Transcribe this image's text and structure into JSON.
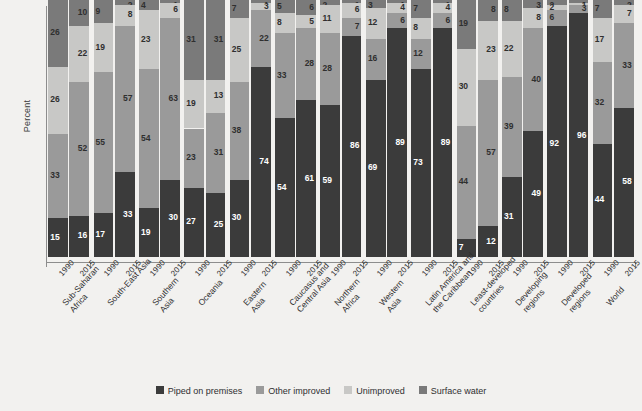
{
  "chart_data": {
    "type": "bar",
    "subtype": "stacked-percent",
    "title": "",
    "xlabel": "",
    "ylabel": "Percent",
    "ylim": [
      0,
      100
    ],
    "grid": false,
    "legend_position": "bottom",
    "series": [
      {
        "name": "Piped on premises",
        "color": "#3b3b3b",
        "values": [
          15,
          16,
          17,
          33,
          19,
          30,
          27,
          25,
          30,
          74,
          54,
          61,
          59,
          86,
          69,
          89,
          73,
          89,
          7,
          12,
          31,
          49,
          92,
          96,
          44,
          58
        ]
      },
      {
        "name": "Other improved",
        "color": "#9a9a9a",
        "values": [
          33,
          52,
          55,
          57,
          54,
          63,
          23,
          31,
          38,
          22,
          33,
          28,
          28,
          7,
          16,
          6,
          12,
          6,
          44,
          57,
          39,
          40,
          6,
          3,
          32,
          33
        ]
      },
      {
        "name": "Unimproved",
        "color": "#c8c8c6",
        "values": [
          26,
          22,
          19,
          8,
          23,
          6,
          19,
          13,
          25,
          3,
          8,
          5,
          11,
          6,
          12,
          4,
          8,
          4,
          30,
          23,
          22,
          8,
          2,
          1,
          17,
          7
        ]
      },
      {
        "name": "Surface water",
        "color": "#7a7a7a",
        "values": [
          26,
          10,
          9,
          2,
          4,
          1,
          31,
          31,
          7,
          1,
          5,
          6,
          2,
          1,
          3,
          1,
          7,
          1,
          19,
          8,
          8,
          3,
          2,
          1,
          7,
          2
        ]
      }
    ],
    "groups": [
      {
        "region": "Sub-Saharan Africa",
        "line1": "Sub-Saharan",
        "line2": "Africa",
        "years": [
          "1990",
          "2015"
        ]
      },
      {
        "region": "South-East Asia",
        "line1": "South-East Asia",
        "line2": "",
        "years": [
          "1990",
          "2015"
        ]
      },
      {
        "region": "Southern Asia",
        "line1": "Southern",
        "line2": "Asia",
        "years": [
          "1990",
          "2015"
        ]
      },
      {
        "region": "Oceania",
        "line1": "Oceania",
        "line2": "",
        "years": [
          "1990",
          "2015"
        ]
      },
      {
        "region": "Eastern Asia",
        "line1": "Eastern",
        "line2": "Asia",
        "years": [
          "1990",
          "2015"
        ]
      },
      {
        "region": "Caucasus and Central Asia",
        "line1": "Caucasus and",
        "line2": "Central Asia",
        "years": [
          "1990",
          "2015"
        ]
      },
      {
        "region": "Northern Africa",
        "line1": "Northern",
        "line2": "Africa",
        "years": [
          "1990",
          "2015"
        ]
      },
      {
        "region": "Western Asia",
        "line1": "Western",
        "line2": "Asia",
        "years": [
          "1990",
          "2015"
        ]
      },
      {
        "region": "Latin America and the Caribbean",
        "line1": "Latin America and",
        "line2": "the Caribbean",
        "years": [
          "1990",
          "2015"
        ]
      },
      {
        "region": "Least-developed countries",
        "line1": "Least-developed",
        "line2": "countries",
        "years": [
          "1990",
          "2015"
        ]
      },
      {
        "region": "Developing regions",
        "line1": "Developing",
        "line2": "regions",
        "years": [
          "1990",
          "2015"
        ]
      },
      {
        "region": "Developed regions",
        "line1": "Developed",
        "line2": "regions",
        "years": [
          "1990",
          "2015"
        ]
      },
      {
        "region": "World",
        "line1": "World",
        "line2": "",
        "years": [
          "1990",
          "2015"
        ]
      }
    ],
    "bars": [
      {
        "region": "Sub-Saharan Africa",
        "year": "1990",
        "piped_on_premises": 15,
        "other_improved": 33,
        "unimproved": 26,
        "surface_water": 26
      },
      {
        "region": "Sub-Saharan Africa",
        "year": "2015",
        "piped_on_premises": 16,
        "other_improved": 52,
        "unimproved": 22,
        "surface_water": 10
      },
      {
        "region": "South-East Asia",
        "year": "1990",
        "piped_on_premises": 17,
        "other_improved": 55,
        "unimproved": 19,
        "surface_water": 9
      },
      {
        "region": "South-East Asia",
        "year": "2015",
        "piped_on_premises": 33,
        "other_improved": 57,
        "unimproved": 8,
        "surface_water": 2
      },
      {
        "region": "Southern Asia",
        "year": "1990",
        "piped_on_premises": 19,
        "other_improved": 54,
        "unimproved": 23,
        "surface_water": 4
      },
      {
        "region": "Southern Asia",
        "year": "2015",
        "piped_on_premises": 30,
        "other_improved": 63,
        "unimproved": 6,
        "surface_water": 1
      },
      {
        "region": "Oceania",
        "year": "1990",
        "piped_on_premises": 27,
        "other_improved": 23,
        "unimproved": 19,
        "surface_water": 31
      },
      {
        "region": "Oceania",
        "year": "2015",
        "piped_on_premises": 25,
        "other_improved": 31,
        "unimproved": 13,
        "surface_water": 31
      },
      {
        "region": "Eastern Asia",
        "year": "1990",
        "piped_on_premises": 30,
        "other_improved": 38,
        "unimproved": 25,
        "surface_water": 7
      },
      {
        "region": "Eastern Asia",
        "year": "2015",
        "piped_on_premises": 74,
        "other_improved": 22,
        "unimproved": 3,
        "surface_water": 1
      },
      {
        "region": "Caucasus and Central Asia",
        "year": "1990",
        "piped_on_premises": 54,
        "other_improved": 33,
        "unimproved": 8,
        "surface_water": 5
      },
      {
        "region": "Caucasus and Central Asia",
        "year": "2015",
        "piped_on_premises": 61,
        "other_improved": 28,
        "unimproved": 5,
        "surface_water": 6
      },
      {
        "region": "Northern Africa",
        "year": "1990",
        "piped_on_premises": 59,
        "other_improved": 28,
        "unimproved": 11,
        "surface_water": 2
      },
      {
        "region": "Northern Africa",
        "year": "2015",
        "piped_on_premises": 86,
        "other_improved": 7,
        "unimproved": 6,
        "surface_water": 1
      },
      {
        "region": "Western Asia",
        "year": "1990",
        "piped_on_premises": 69,
        "other_improved": 16,
        "unimproved": 12,
        "surface_water": 3
      },
      {
        "region": "Western Asia",
        "year": "2015",
        "piped_on_premises": 89,
        "other_improved": 6,
        "unimproved": 4,
        "surface_water": 1
      },
      {
        "region": "Latin America and the Caribbean",
        "year": "1990",
        "piped_on_premises": 73,
        "other_improved": 12,
        "unimproved": 8,
        "surface_water": 7
      },
      {
        "region": "Latin America and the Caribbean",
        "year": "2015",
        "piped_on_premises": 89,
        "other_improved": 6,
        "unimproved": 4,
        "surface_water": 1
      },
      {
        "region": "Least-developed countries",
        "year": "1990",
        "piped_on_premises": 7,
        "other_improved": 44,
        "unimproved": 30,
        "surface_water": 19
      },
      {
        "region": "Least-developed countries",
        "year": "2015",
        "piped_on_premises": 12,
        "other_improved": 57,
        "unimproved": 23,
        "surface_water": 8
      },
      {
        "region": "Developing regions",
        "year": "1990",
        "piped_on_premises": 31,
        "other_improved": 39,
        "unimproved": 22,
        "surface_water": 8
      },
      {
        "region": "Developing regions",
        "year": "2015",
        "piped_on_premises": 49,
        "other_improved": 40,
        "unimproved": 8,
        "surface_water": 3
      },
      {
        "region": "Developed regions",
        "year": "1990",
        "piped_on_premises": 92,
        "other_improved": 6,
        "unimproved": 2,
        "surface_water": 2
      },
      {
        "region": "Developed regions",
        "year": "2015",
        "piped_on_premises": 96,
        "other_improved": 3,
        "unimproved": 1,
        "surface_water": 1
      },
      {
        "region": "World",
        "year": "1990",
        "piped_on_premises": 44,
        "other_improved": 32,
        "unimproved": 17,
        "surface_water": 7
      },
      {
        "region": "World",
        "year": "2015",
        "piped_on_premises": 58,
        "other_improved": 33,
        "unimproved": 7,
        "surface_water": 2
      }
    ]
  },
  "legend": {
    "items": [
      {
        "label": "Piped on premises",
        "color": "#3b3b3b"
      },
      {
        "label": "Other improved",
        "color": "#9a9a9a"
      },
      {
        "label": "Unimproved",
        "color": "#c8c8c6"
      },
      {
        "label": "Surface water",
        "color": "#7a7a7a"
      }
    ]
  },
  "colors": {
    "background": "#f2f1ef",
    "axis": "#8d8d8d",
    "text": "#2f2f2f",
    "label_on_dark": "#ffffff",
    "label_on_light": "#2f2f2f"
  }
}
